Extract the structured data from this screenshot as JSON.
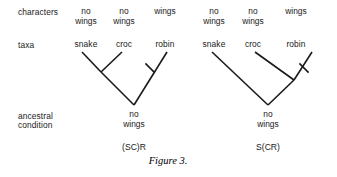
{
  "figure": {
    "caption": "Figure 3.",
    "caption_x": 168,
    "caption_y": 155
  },
  "row_labels": [
    {
      "text": "characters",
      "x": 18,
      "y": 8
    },
    {
      "text": "taxa",
      "x": 18,
      "y": 41
    },
    {
      "text": "ancestral",
      "x": 18,
      "y": 112
    },
    {
      "text": "condition",
      "x": 18,
      "y": 121
    }
  ],
  "columns": [
    {
      "id": "left-snake",
      "character_line1": "no",
      "character_line2": "wings",
      "taxon": "snake",
      "x": 86
    },
    {
      "id": "left-croc",
      "character_line1": "no",
      "character_line2": "wings",
      "taxon": "croc",
      "x": 124
    },
    {
      "id": "left-robin",
      "character_line1": "",
      "character_line2": "wings",
      "taxon": "robin",
      "x": 165
    },
    {
      "id": "right-snake",
      "character_line1": "no",
      "character_line2": "wings",
      "taxon": "snake",
      "x": 214
    },
    {
      "id": "right-croc",
      "character_line1": "no",
      "character_line2": "wings",
      "taxon": "croc",
      "x": 253
    },
    {
      "id": "right-robin",
      "character_line1": "",
      "character_line2": "wings",
      "taxon": "robin",
      "x": 296
    }
  ],
  "trees": [
    {
      "id": "left-tree",
      "code": "(SC)R",
      "code_x": 134,
      "code_y": 142,
      "ancestral_line1": "no",
      "ancestral_line2": "wings",
      "ancestral_x": 134,
      "ancestral_y": 110,
      "root": {
        "x": 134,
        "y": 105
      },
      "internal_node": {
        "x": 101,
        "y": 72
      },
      "tips": {
        "snake": {
          "x": 82,
          "y": 52
        },
        "croc": {
          "x": 122,
          "y": 52
        },
        "robin": {
          "x": 167,
          "y": 52
        }
      },
      "branches": [
        {
          "name": "snake-branch",
          "x1": 82,
          "y1": 52,
          "x2": 101,
          "y2": 72
        },
        {
          "name": "croc-branch",
          "x1": 122,
          "y1": 52,
          "x2": 101,
          "y2": 72
        },
        {
          "name": "internal-branch",
          "x1": 101,
          "y1": 72,
          "x2": 134,
          "y2": 105
        },
        {
          "name": "robin-branch",
          "x1": 167,
          "y1": 52,
          "x2": 134,
          "y2": 105
        }
      ],
      "tick_marks": [
        {
          "name": "wing-gain-tick",
          "x": 150,
          "y": 68,
          "angle": 45,
          "length": 13
        }
      ]
    },
    {
      "id": "right-tree",
      "code": "S(CR)",
      "code_x": 268,
      "code_y": 142,
      "ancestral_line1": "no",
      "ancestral_line2": "wings",
      "ancestral_x": 268,
      "ancestral_y": 110,
      "root": {
        "x": 268,
        "y": 105
      },
      "internal_node": {
        "x": 294,
        "y": 80
      },
      "tips": {
        "snake": {
          "x": 212,
          "y": 52
        },
        "croc": {
          "x": 255,
          "y": 52
        },
        "robin": {
          "x": 312,
          "y": 52
        }
      },
      "branches": [
        {
          "name": "snake-branch",
          "x1": 212,
          "y1": 52,
          "x2": 268,
          "y2": 105
        },
        {
          "name": "internal-branch",
          "x1": 294,
          "y1": 80,
          "x2": 268,
          "y2": 105
        },
        {
          "name": "croc-branch",
          "x1": 255,
          "y1": 52,
          "x2": 294,
          "y2": 80
        },
        {
          "name": "robin-branch",
          "x1": 312,
          "y1": 52,
          "x2": 294,
          "y2": 80
        }
      ],
      "tick_marks": [
        {
          "name": "wing-gain-tick",
          "x": 304,
          "y": 68,
          "angle": 45,
          "length": 13
        }
      ]
    }
  ],
  "style": {
    "line_color": "#1a1a1a",
    "line_width": 1.6,
    "background": "#ffffff"
  }
}
